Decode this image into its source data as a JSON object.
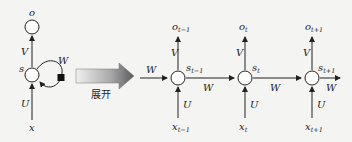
{
  "diagram": {
    "folded": {
      "output": "o",
      "state": "s",
      "input": "x",
      "weights": {
        "input": "U",
        "output": "V",
        "recurrent": "W"
      }
    },
    "arrow_label": "展开",
    "unrolled": [
      {
        "o": "o",
        "o_sub": "t−1",
        "s": "s",
        "s_sub": "t−1",
        "x": "x",
        "x_sub": "t−1"
      },
      {
        "o": "o",
        "o_sub": "t",
        "s": "s",
        "s_sub": "t",
        "x": "x",
        "x_sub": "t"
      },
      {
        "o": "o",
        "o_sub": "t+1",
        "s": "s",
        "s_sub": "t+1",
        "x": "x",
        "x_sub": "t+1"
      }
    ],
    "weight_labels": {
      "U": "U",
      "V": "V",
      "W": "W"
    },
    "colors": {
      "background": "#f4f4f2",
      "stroke": "#222222",
      "arrow_dark": "#6a6a6a",
      "arrow_light": "#e8e8e8"
    }
  }
}
